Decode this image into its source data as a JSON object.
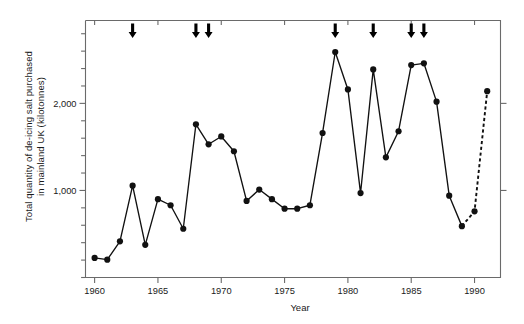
{
  "figure": {
    "background": "#ffffff",
    "ink_color": "#111111",
    "axis_color": "#6a6a6a"
  },
  "axis_labels": {
    "y_line1": "Total quantity of de-icing salt purchased",
    "y_line2": "in mainland UK (kilotonnes)",
    "x": "Year"
  },
  "chart_data": {
    "type": "line",
    "title": "",
    "subtitle": "",
    "xlabel": "Year",
    "ylabel": "Total quantity of de-icing salt purchased in mainland UK (kilotonnes)",
    "xlim": [
      1959.3,
      1992.2
    ],
    "ylim": [
      0,
      2950
    ],
    "grid": false,
    "legend": null,
    "x_major_ticks": [
      1960,
      1965,
      1970,
      1975,
      1980,
      1985,
      1990
    ],
    "x_tick_labels": [
      "1960",
      "1965",
      "1970",
      "1975",
      "1980",
      "1985",
      "1990"
    ],
    "y_major_ticks": [
      1000,
      2000
    ],
    "y_tick_labels": [
      "1,000",
      "2,000"
    ],
    "y_minor_tick_step": 200,
    "marker": "filled-circle",
    "series": [
      {
        "name": "De-icing salt purchased",
        "line_style": "solid",
        "x": [
          1960,
          1961,
          1962,
          1963,
          1964,
          1965,
          1966,
          1967,
          1968,
          1969,
          1970,
          1971,
          1972,
          1973,
          1974,
          1975,
          1976,
          1977,
          1978,
          1979,
          1980,
          1981,
          1982,
          1983,
          1984,
          1985,
          1986,
          1987,
          1988,
          1989
        ],
        "values": [
          225,
          205,
          415,
          1055,
          375,
          900,
          830,
          560,
          1760,
          1530,
          1620,
          1450,
          880,
          1010,
          900,
          790,
          790,
          830,
          1660,
          2590,
          2160,
          970,
          2390,
          1380,
          1680,
          2440,
          2460,
          2020,
          940,
          590
        ]
      },
      {
        "name": "De-icing salt purchased (estimated)",
        "line_style": "dashed",
        "x": [
          1989,
          1990,
          1991
        ],
        "values": [
          590,
          760,
          2140
        ]
      }
    ],
    "annotations": {
      "type": "down-arrows",
      "description": "Downward arrows above plot marking severe winters",
      "years": [
        1963,
        1968,
        1969,
        1979,
        1982,
        1985,
        1986
      ]
    }
  }
}
